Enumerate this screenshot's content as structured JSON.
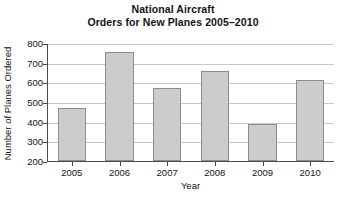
{
  "chart_data": {
    "type": "bar",
    "title": "National Aircraft Orders for New Planes 2005–2010",
    "title_lines": [
      "National Aircraft",
      "Orders for New Planes 2005–2010"
    ],
    "xlabel": "Year",
    "ylabel": "Number of Planes Ordered",
    "categories": [
      "2005",
      "2006",
      "2007",
      "2008",
      "2009",
      "2010"
    ],
    "values": [
      470,
      755,
      570,
      660,
      390,
      610
    ],
    "ylim": [
      200,
      800
    ],
    "yticks": [
      200,
      300,
      400,
      500,
      600,
      700,
      800
    ],
    "ytick_labels": [
      "200",
      "300",
      "400",
      "500",
      "600",
      "700",
      "800"
    ],
    "grid": true,
    "legend": false,
    "bar_color": "#cccccc",
    "bar_edge_color": "#8c8c8c",
    "axis_color": "#4a4a4a",
    "grid_color": "#c8c8c8",
    "background": "#ffffff"
  }
}
